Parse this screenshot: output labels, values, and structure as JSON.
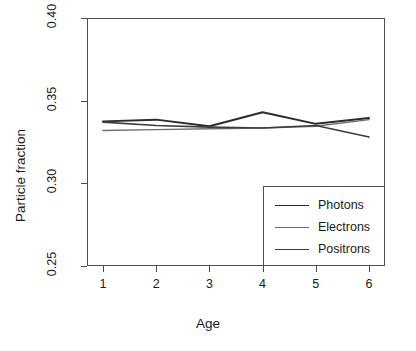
{
  "chart_data": {
    "type": "line",
    "title": "",
    "xlabel": "Age",
    "ylabel": "Particle fraction",
    "x": [
      1,
      2,
      3,
      4,
      5,
      6
    ],
    "xlim": [
      0.7,
      6.3
    ],
    "ylim": [
      0.25,
      0.4
    ],
    "xticks": [
      "1",
      "2",
      "3",
      "4",
      "5",
      "6"
    ],
    "yticks": [
      "0.25",
      "0.30",
      "0.35",
      "0.40"
    ],
    "ytick_values": [
      0.25,
      0.3,
      0.35,
      0.4
    ],
    "grid": false,
    "legend_position": "bottom-right",
    "series": [
      {
        "name": "Photons",
        "color": "#2b2b2b",
        "width": 1.9,
        "values": [
          0.3375,
          0.3385,
          0.3345,
          0.343,
          0.336,
          0.3395
        ]
      },
      {
        "name": "Electrons",
        "color": "#6e6e6e",
        "width": 1.4,
        "values": [
          0.332,
          0.3325,
          0.333,
          0.3335,
          0.3345,
          0.3385
        ]
      },
      {
        "name": "Positrons",
        "color": "#3d3d3d",
        "width": 1.6,
        "values": [
          0.337,
          0.335,
          0.334,
          0.3335,
          0.335,
          0.328
        ]
      }
    ]
  },
  "axes": {
    "y_title": "Particle fraction",
    "x_title": "Age"
  },
  "legend": {
    "entries": [
      {
        "label": "Photons"
      },
      {
        "label": "Electrons"
      },
      {
        "label": "Positrons"
      }
    ]
  }
}
